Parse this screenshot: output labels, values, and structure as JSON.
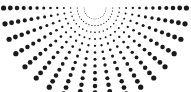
{
  "figure": {
    "name": "radial-dot-fan",
    "width": 191,
    "height": 92,
    "background_color": "#ffffff",
    "dot_color": "#1a1a1a"
  },
  "chart_data": {
    "type": "scatter",
    "subtitle": "",
    "xlabel": "",
    "ylabel": "",
    "grid": false,
    "legend": null,
    "legend_position": "none",
    "xlim": [
      0,
      191
    ],
    "ylim": [
      0,
      92
    ],
    "coordinate_system": "polar",
    "origin": {
      "x": 95,
      "y": 8
    },
    "angle_start_deg": 0,
    "angle_end_deg": 180,
    "spoke_count": 19,
    "angle_step_deg": 10,
    "ring_count": 13,
    "ring_radius_start": 11,
    "ring_radius_step": 6.7,
    "dot_radius_min": 0.45,
    "dot_radius_max": 2.6,
    "dot_radius_growth": "linear-with-radius",
    "marker": "circle",
    "marker_color": "#1a1a1a",
    "rings": [
      {
        "index": 0,
        "radius": 11.0,
        "dot_radius": 0.45
      },
      {
        "index": 1,
        "radius": 17.7,
        "dot_radius": 0.62
      },
      {
        "index": 2,
        "radius": 24.4,
        "dot_radius": 0.8
      },
      {
        "index": 3,
        "radius": 31.1,
        "dot_radius": 0.98
      },
      {
        "index": 4,
        "radius": 37.8,
        "dot_radius": 1.16
      },
      {
        "index": 5,
        "radius": 44.5,
        "dot_radius": 1.34
      },
      {
        "index": 6,
        "radius": 51.2,
        "dot_radius": 1.52
      },
      {
        "index": 7,
        "radius": 57.9,
        "dot_radius": 1.7
      },
      {
        "index": 8,
        "radius": 64.6,
        "dot_radius": 1.88
      },
      {
        "index": 9,
        "radius": 71.3,
        "dot_radius": 2.06
      },
      {
        "index": 10,
        "radius": 78.0,
        "dot_radius": 2.24
      },
      {
        "index": 11,
        "radius": 84.7,
        "dot_radius": 2.42
      },
      {
        "index": 12,
        "radius": 91.4,
        "dot_radius": 2.6
      }
    ],
    "spokes": [
      {
        "index": 0,
        "angle_deg": 0
      },
      {
        "index": 1,
        "angle_deg": 10
      },
      {
        "index": 2,
        "angle_deg": 20
      },
      {
        "index": 3,
        "angle_deg": 30
      },
      {
        "index": 4,
        "angle_deg": 40
      },
      {
        "index": 5,
        "angle_deg": 50
      },
      {
        "index": 6,
        "angle_deg": 60
      },
      {
        "index": 7,
        "angle_deg": 70
      },
      {
        "index": 8,
        "angle_deg": 80
      },
      {
        "index": 9,
        "angle_deg": 90
      },
      {
        "index": 10,
        "angle_deg": 100
      },
      {
        "index": 11,
        "angle_deg": 110
      },
      {
        "index": 12,
        "angle_deg": 120
      },
      {
        "index": 13,
        "angle_deg": 130
      },
      {
        "index": 14,
        "angle_deg": 140
      },
      {
        "index": 15,
        "angle_deg": 150
      },
      {
        "index": 16,
        "angle_deg": 160
      },
      {
        "index": 17,
        "angle_deg": 170
      },
      {
        "index": 18,
        "angle_deg": 180
      }
    ]
  }
}
